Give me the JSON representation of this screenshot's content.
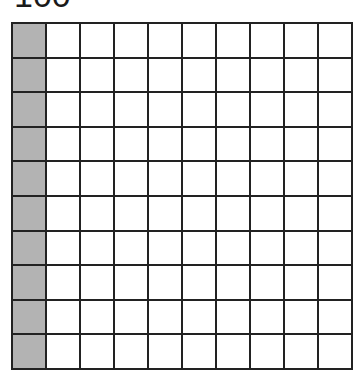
{
  "title": "100",
  "grid": {
    "rows": 10,
    "cols": 10,
    "shaded_columns": [
      0
    ],
    "shaded_color": "#b3b3b3",
    "line_color": "#222222"
  }
}
